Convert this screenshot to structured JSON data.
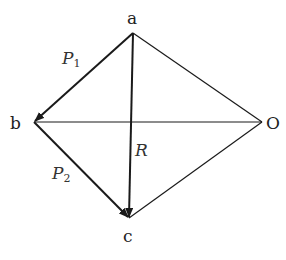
{
  "diagram": {
    "title": "",
    "type": "vector-force-diagram",
    "points": {
      "a": {
        "label": "a",
        "x": 133,
        "y": 33
      },
      "b": {
        "label": "b",
        "x": 34,
        "y": 122
      },
      "c": {
        "label": "c",
        "x": 129,
        "y": 218
      },
      "O": {
        "label": "O",
        "x": 262,
        "y": 122
      }
    },
    "vectors": [
      {
        "name": "P1",
        "label": "P",
        "subscript": "1",
        "from": "a",
        "to": "b",
        "arrow": true
      },
      {
        "name": "P2",
        "label": "P",
        "subscript": "2",
        "from": "b",
        "to": "c",
        "arrow": true
      },
      {
        "name": "R",
        "label": "R",
        "subscript": "",
        "from": "a",
        "to": "c",
        "arrow": true
      }
    ],
    "segments": [
      {
        "from": "a",
        "to": "O"
      },
      {
        "from": "b",
        "to": "O"
      },
      {
        "from": "c",
        "to": "O"
      }
    ],
    "colors": {
      "line": "#1a1a1a",
      "text": "#222222"
    }
  }
}
